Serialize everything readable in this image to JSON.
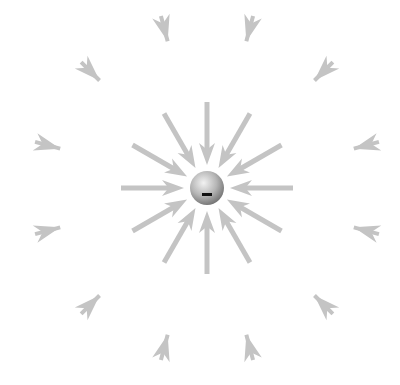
{
  "diagram": {
    "charge": {
      "sign_symbol": "−",
      "type": "negative",
      "center_x": 207,
      "center_y": 188,
      "radius": 17
    },
    "colors": {
      "background": "#ffffff",
      "arrow": "#c4c4c4",
      "sphere_light": "#f2f2f2",
      "sphere_mid": "#b5b5b5",
      "sphere_dark": "#6e6e6e",
      "sign": "#111111"
    },
    "inner_field_lines": {
      "count": 12,
      "start_angle_deg": 0,
      "step_deg": 30,
      "tail_radius": 86,
      "tip_radius": 23,
      "direction": "inward"
    },
    "outer_field_arrowheads": {
      "count": 12,
      "start_angle_deg": 15,
      "step_deg": 30,
      "tip_radius": 152,
      "length": 26,
      "direction": "inward"
    }
  }
}
